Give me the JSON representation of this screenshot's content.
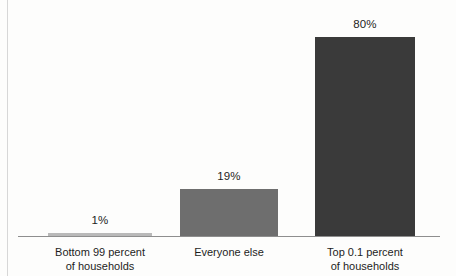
{
  "chart_data": {
    "type": "bar",
    "title": "",
    "subtitle": "",
    "xlabel": "",
    "ylabel": "",
    "ylim": [
      0,
      100
    ],
    "grid": false,
    "legend": "none",
    "orientation": "vertical",
    "categories": [
      "Bottom 99 percent of households",
      "Everyone else",
      "Top 0.1 percent of households"
    ],
    "category_lines": [
      [
        "Bottom 99 percent",
        "of households"
      ],
      [
        "Everyone else",
        ""
      ],
      [
        "Top 0.1 percent",
        "of households"
      ]
    ],
    "values": [
      1,
      19,
      80
    ],
    "value_labels": [
      "1%",
      "19%",
      "80%"
    ],
    "bar_colors": [
      "#b9b9b9",
      "#6e6e6e",
      "#3a3a3a"
    ],
    "axis_color": "#8e8e8e",
    "background": "#fdfdfc",
    "text_color": "#1d1d1d"
  }
}
